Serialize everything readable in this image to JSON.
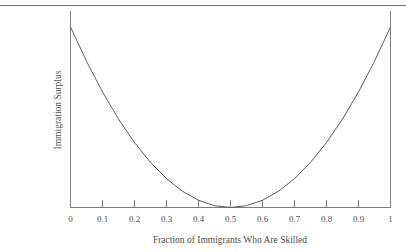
{
  "figure": {
    "background_color": "#ffffff",
    "rule_color": "#6e6e6e",
    "axis_color": "#7a7a7a",
    "curve_color": "#5d5d5d",
    "text_color": "#4f4f4f"
  },
  "chart_data": {
    "type": "line",
    "title": "",
    "subtitle": "",
    "xlabel": "Fraction of Immigrants Who Are Skilled",
    "ylabel": "Immigration Surplus",
    "xlim": [
      0,
      1
    ],
    "ylim": [
      0,
      1
    ],
    "grid": false,
    "legend": null,
    "xticks": [
      0,
      0.1,
      0.2,
      0.3,
      0.4,
      0.5,
      0.6,
      0.7,
      0.8,
      0.9,
      1
    ],
    "xtick_labels": [
      "0",
      "0.1",
      "0.2",
      "0.3",
      "0.4",
      "0.5",
      "0.6",
      "0.7",
      "0.8",
      "0.9",
      "1"
    ],
    "yticks": [],
    "ytick_labels": [],
    "annotations": [],
    "series": [
      {
        "name": "Immigration Surplus",
        "shape": "u-shaped convex parabola, minimum at x=0.5 touching the horizontal axis, symmetric endpoints at maximum height",
        "x": [
          0.0,
          0.05,
          0.1,
          0.15,
          0.2,
          0.25,
          0.3,
          0.35,
          0.4,
          0.45,
          0.5,
          0.55,
          0.6,
          0.65,
          0.7,
          0.75,
          0.8,
          0.85,
          0.9,
          0.95,
          1.0
        ],
        "y": [
          1.0,
          0.81,
          0.64,
          0.49,
          0.36,
          0.25,
          0.16,
          0.09,
          0.04,
          0.01,
          0.0,
          0.01,
          0.04,
          0.09,
          0.16,
          0.25,
          0.36,
          0.49,
          0.64,
          0.81,
          1.0
        ]
      }
    ]
  },
  "labels": {
    "xtitle": "Fraction of Immigrants Who Are Skilled",
    "ytitle": "Immigration Surplus",
    "x0": "0",
    "x1": "0.1",
    "x2": "0.2",
    "x3": "0.3",
    "x4": "0.4",
    "x5": "0.5",
    "x6": "0.6",
    "x7": "0.7",
    "x8": "0.8",
    "x9": "0.9",
    "x10": "1"
  }
}
